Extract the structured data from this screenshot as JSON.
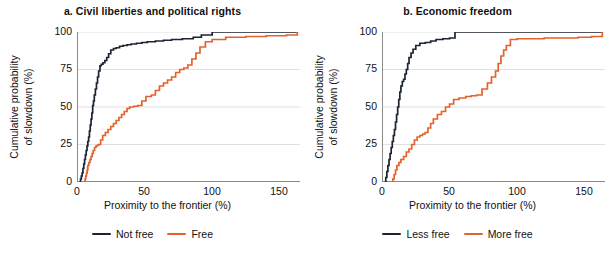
{
  "figure": {
    "width": 610,
    "height": 258,
    "background": "#ffffff"
  },
  "colors": {
    "series_dark": "#1b2430",
    "series_orange": "#e4622c",
    "gridline": "#d8d8d8",
    "axis": "#8a8a8a",
    "text": "#111111"
  },
  "chart_data": [
    {
      "type": "line",
      "panel_id": "a",
      "title": "a. Civil liberties and political rights",
      "xlabel": "Proximity to the frontier (%)",
      "ylabel": "Cumulative probability\nof slowdown (%)",
      "xlim": [
        0,
        165
      ],
      "ylim": [
        0,
        100
      ],
      "xticks": [
        0,
        50,
        100,
        150
      ],
      "yticks": [
        0,
        25,
        50,
        75,
        100
      ],
      "xticklabels": [
        "0",
        "50",
        "100",
        "150"
      ],
      "yticklabels": [
        "0",
        "25",
        "50",
        "75",
        "100"
      ],
      "grid": "horizontal",
      "legend_position": "below",
      "step_shape": "post",
      "series": [
        {
          "name": "Not free",
          "color": "#1b2430",
          "x": [
            2.0,
            2.6,
            3.2,
            3.8,
            4.4,
            5.0,
            5.6,
            6.2,
            6.8,
            7.4,
            8.0,
            8.6,
            9.2,
            9.8,
            10.4,
            11.0,
            11.6,
            12.2,
            12.8,
            13.6,
            14.4,
            15.2,
            16.0,
            17.0,
            18.0,
            19.2,
            20.6,
            22.0,
            23.4,
            25.0,
            27.0,
            29.0,
            31.5,
            34.0,
            37.0,
            40.0,
            44.0,
            48.0,
            52.0,
            58.0,
            64.0,
            70.0,
            78.0,
            86.0,
            92.0,
            100.0,
            120.0,
            140.0,
            163.0
          ],
          "y": [
            0.0,
            2.0,
            4.0,
            6.0,
            9.0,
            12.0,
            15.0,
            18.0,
            21.0,
            24.0,
            27.0,
            30.0,
            34.0,
            38.0,
            42.0,
            46.0,
            51.0,
            54.0,
            58.0,
            62.0,
            66.0,
            70.0,
            74.0,
            77.5,
            78.5,
            79.5,
            81.0,
            83.0,
            85.5,
            88.0,
            89.0,
            89.5,
            90.5,
            91.0,
            91.5,
            92.0,
            92.5,
            93.0,
            93.5,
            94.0,
            94.5,
            95.0,
            95.5,
            96.5,
            98.0,
            100.0,
            100.0,
            100.0,
            100.0
          ]
        },
        {
          "name": "Free",
          "color": "#e4622c",
          "x": [
            3.0,
            6.0,
            6.5,
            7.0,
            7.5,
            8.0,
            8.8,
            9.6,
            10.4,
            11.2,
            12.0,
            13.0,
            14.0,
            15.0,
            16.0,
            17.5,
            19.0,
            21.0,
            23.0,
            25.0,
            27.0,
            29.0,
            31.0,
            33.0,
            35.0,
            37.0,
            39.0,
            42.0,
            45.0,
            48.0,
            51.0,
            55.0,
            58.0,
            61.0,
            64.0,
            67.0,
            70.0,
            73.0,
            76.0,
            79.0,
            82.0,
            85.0,
            88.0,
            91.0,
            95.0,
            100.0,
            110.0,
            125.0,
            140.0,
            155.0,
            163.0
          ],
          "y": [
            0.0,
            2.0,
            4.0,
            6.0,
            8.0,
            11.0,
            13.0,
            15.0,
            17.0,
            19.0,
            21.0,
            23.0,
            24.0,
            24.5,
            25.0,
            28.0,
            31.0,
            33.0,
            35.0,
            37.0,
            39.0,
            41.0,
            43.0,
            45.0,
            47.0,
            49.0,
            50.0,
            50.5,
            51.0,
            54.0,
            57.0,
            58.0,
            61.0,
            64.0,
            66.0,
            68.0,
            70.0,
            73.0,
            75.0,
            76.0,
            78.0,
            82.0,
            86.0,
            90.0,
            93.5,
            95.0,
            96.5,
            97.0,
            97.5,
            98.0,
            100.0
          ]
        }
      ],
      "legend": [
        {
          "label": "Not free",
          "color": "#1b2430"
        },
        {
          "label": "Free",
          "color": "#e4622c"
        }
      ]
    },
    {
      "type": "line",
      "panel_id": "b",
      "title": "b. Economic freedom",
      "xlabel": "Proximity to the frontier (%)",
      "ylabel": "Cumulative probability\nof slowdown (%)",
      "xlim": [
        0,
        165
      ],
      "ylim": [
        0,
        100
      ],
      "xticks": [
        0,
        50,
        100,
        150
      ],
      "yticks": [
        0,
        25,
        50,
        75,
        100
      ],
      "xticklabels": [
        "0",
        "50",
        "100",
        "150"
      ],
      "yticklabels": [
        "0",
        "25",
        "50",
        "75",
        "100"
      ],
      "grid": "horizontal",
      "legend_position": "below",
      "step_shape": "post",
      "series": [
        {
          "name": "Less free",
          "color": "#1b2430",
          "x": [
            2.0,
            2.8,
            3.6,
            4.4,
            5.2,
            6.0,
            6.8,
            7.6,
            8.4,
            9.2,
            10.0,
            10.8,
            11.6,
            12.4,
            13.2,
            14.0,
            15.0,
            16.0,
            17.0,
            18.0,
            19.0,
            20.0,
            21.5,
            23.0,
            25.0,
            28.0,
            32.0,
            36.0,
            40.0,
            45.0,
            50.0,
            54.0,
            60.0,
            80.0,
            110.0,
            140.0,
            163.0
          ],
          "y": [
            0.0,
            3.0,
            7.0,
            11.0,
            15.0,
            19.0,
            23.0,
            27.0,
            31.0,
            35.0,
            40.0,
            45.0,
            50.0,
            55.0,
            60.0,
            64.0,
            67.0,
            68.5,
            72.0,
            75.0,
            79.0,
            83.0,
            86.0,
            88.5,
            91.0,
            92.5,
            93.0,
            94.0,
            95.0,
            95.5,
            96.0,
            100.0,
            100.0,
            100.0,
            100.0,
            100.0,
            100.0
          ]
        },
        {
          "name": "More free",
          "color": "#e4622c",
          "x": [
            5.0,
            8.0,
            9.0,
            10.0,
            11.0,
            12.5,
            14.0,
            16.0,
            18.0,
            20.0,
            22.0,
            24.0,
            26.0,
            28.0,
            30.0,
            32.0,
            34.0,
            36.0,
            38.0,
            41.0,
            44.0,
            47.0,
            50.0,
            53.0,
            57.0,
            62.0,
            66.0,
            70.0,
            74.0,
            78.0,
            81.0,
            84.0,
            86.0,
            88.0,
            90.0,
            92.0,
            95.0,
            100.0,
            120.0,
            145.0,
            155.0,
            163.0
          ],
          "y": [
            0.0,
            2.0,
            5.0,
            8.0,
            11.0,
            13.0,
            15.0,
            17.0,
            20.0,
            22.0,
            25.0,
            28.0,
            30.0,
            31.0,
            32.0,
            33.0,
            36.0,
            39.0,
            42.0,
            45.0,
            47.0,
            50.0,
            52.0,
            55.0,
            56.0,
            57.0,
            57.5,
            58.0,
            62.0,
            66.0,
            70.0,
            74.0,
            79.0,
            84.0,
            88.0,
            91.0,
            95.0,
            95.5,
            96.0,
            96.5,
            97.0,
            100.0
          ]
        }
      ],
      "legend": [
        {
          "label": "Less free",
          "color": "#1b2430"
        },
        {
          "label": "More free",
          "color": "#e4622c"
        }
      ]
    }
  ]
}
